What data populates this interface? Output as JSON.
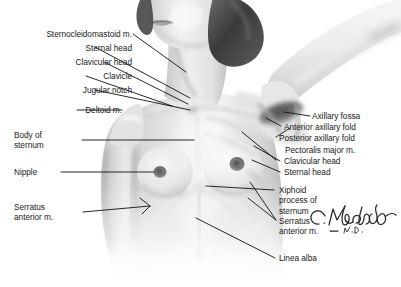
{
  "figure": {
    "background_color": "#ffffff",
    "label_color": "#1a1a1a",
    "leader_line_color": "#111111"
  },
  "signature": {
    "name": "C.Machado",
    "credential": "M.D."
  },
  "labels_left": [
    {
      "id": "sternocleidomastoid",
      "text": "Sternocleidomastoid m."
    },
    {
      "id": "sternal-head-left",
      "text": "Sternal head"
    },
    {
      "id": "clavicular-head-left",
      "text": "Clavicular head"
    },
    {
      "id": "clavicle",
      "text": "Clavicle"
    },
    {
      "id": "jugular-notch",
      "text": "Jugular notch"
    },
    {
      "id": "deltoid",
      "text": "Deltoid m."
    },
    {
      "id": "body-of-sternum",
      "line1": "Body of",
      "line2": "sternum"
    },
    {
      "id": "nipple",
      "text": "Nipple"
    },
    {
      "id": "serratus-anterior-left",
      "line1": "Serratus",
      "line2": "anterior m."
    }
  ],
  "labels_right": [
    {
      "id": "axillary-fossa",
      "text": "Axillary fossa"
    },
    {
      "id": "anterior-axillary-fold",
      "text": "Anterior axillary fold"
    },
    {
      "id": "posterior-axillary-fold",
      "text": "Posterior axillary fold"
    },
    {
      "id": "pectoralis-major",
      "text": "Pectoralis major m."
    },
    {
      "id": "clavicular-head-right",
      "text": "Clavicular head"
    },
    {
      "id": "sternal-head-right",
      "text": "Sternal head"
    },
    {
      "id": "xiphoid-process",
      "line1": "Xiphoid",
      "line2": "process of",
      "line3": "sternum"
    },
    {
      "id": "serratus-anterior-right",
      "line1": "Serratus",
      "line2": "anterior m."
    },
    {
      "id": "linea-alba",
      "text": "Linea alba"
    }
  ]
}
